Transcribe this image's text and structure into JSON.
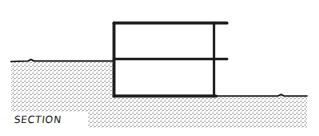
{
  "diagram": {
    "type": "architectural-section",
    "label": "SECTION",
    "colors": {
      "ink": "#1a1a1a",
      "paper": "#ffffff",
      "stipple": "#3a3a3a"
    },
    "elements": {
      "structure": {
        "description": "Two-storey box set into a slope; upper floor line and roof slab cantilever beyond the right wall",
        "left_wall_x": 114,
        "right_wall_x": 214,
        "roof_y": 23,
        "middle_floor_y": 59,
        "base_y": 96,
        "slab_extension_x": 227
      },
      "ground": {
        "upper_grade_y": 61,
        "upper_grade_start_x": 11,
        "lower_grade_y": 96,
        "lower_grade_end_x": 307,
        "stipple_bottom_y": 128
      }
    }
  }
}
